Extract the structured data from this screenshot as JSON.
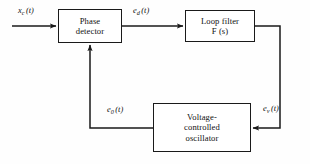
{
  "diagram": {
    "background_color": "#fefefe",
    "stroke_color": "#1a1a1a",
    "text_color": "#111111",
    "blocks": [
      {
        "id": "phase-detector",
        "label": "Phase\ndetector"
      },
      {
        "id": "loop-filter",
        "label": "Loop filter\nF (s)"
      },
      {
        "id": "vco",
        "label": "Voltage-\ncontrolled\noscillator"
      }
    ],
    "signals": [
      {
        "id": "xc",
        "base": "x",
        "sub": "c",
        "arg": "(t)"
      },
      {
        "id": "ed",
        "base": "e",
        "sub": "d",
        "arg": "(t)"
      },
      {
        "id": "e0",
        "base": "e",
        "sub": "0",
        "arg": "(t)"
      },
      {
        "id": "ev",
        "base": "e",
        "sub": "v",
        "arg": "(t)"
      }
    ]
  }
}
